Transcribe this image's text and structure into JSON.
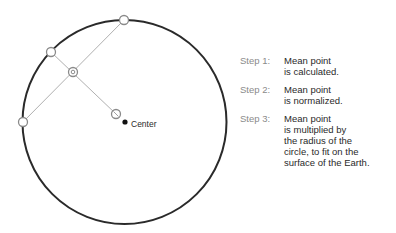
{
  "diagram": {
    "circle": {
      "cx": 124.5,
      "cy": 122,
      "r": 102,
      "stroke": "#2a2a2a"
    },
    "points": {
      "top": {
        "x": 124,
        "y": 20
      },
      "upper_left": {
        "x": 51,
        "y": 52
      },
      "left": {
        "x": 23,
        "y": 122
      },
      "mean": {
        "x": 73,
        "y": 72
      },
      "normalized": {
        "x": 116,
        "y": 114
      },
      "center": {
        "x": 125,
        "y": 122
      }
    },
    "center_label": "Center",
    "line_color": "#b0b0b0"
  },
  "steps": [
    {
      "label": "Step 1:",
      "lines": [
        "Mean point",
        "is calculated."
      ]
    },
    {
      "label": "Step 2:",
      "lines": [
        "Mean point",
        "is normalized."
      ]
    },
    {
      "label": "Step 3:",
      "lines": [
        "Mean point",
        "is multiplied by",
        "the radius of the",
        "circle, to fit on the",
        "surface of the Earth."
      ]
    }
  ]
}
